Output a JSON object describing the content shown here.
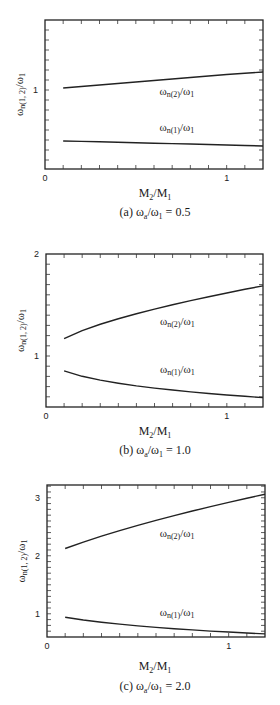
{
  "chart_data": [
    {
      "type": "line",
      "panel_id": "a",
      "caption": "(a) ωa/ω1 = 0.5",
      "caption_parts": {
        "prefix": "(a) ω",
        "sub1": "a",
        "mid": "/ω",
        "sub2": "1",
        "suffix": " = 0.5"
      },
      "xlabel": "M2/M1",
      "ylabel": "ωn(1, 2)/ω1",
      "xlim": [
        0,
        1.2
      ],
      "ylim": [
        0.21,
        1.7
      ],
      "x_ticks_labeled": [
        0,
        1
      ],
      "y_ticks_labeled": [
        1
      ],
      "x_minor_step": 0.1,
      "y_minor_step": 0.1,
      "grid": false,
      "x": [
        0.1,
        0.2,
        0.3,
        0.4,
        0.5,
        0.6,
        0.7,
        0.8,
        0.9,
        1.0,
        1.1,
        1.2
      ],
      "series": [
        {
          "name": "ωn(2)/ω1",
          "label_main": "ω",
          "label_sub": "n(2)",
          "label_rest": "/ω",
          "label_sub2": "1",
          "values": [
            1.02,
            1.035,
            1.05,
            1.065,
            1.08,
            1.095,
            1.11,
            1.125,
            1.14,
            1.155,
            1.168,
            1.18
          ],
          "label_pos": [
            0.63,
            0.95
          ]
        },
        {
          "name": "ωn(1)/ω1",
          "label_main": "ω",
          "label_sub": "n(1)",
          "label_rest": "/ω",
          "label_sub2": "1",
          "values": [
            0.49,
            0.486,
            0.482,
            0.477,
            0.472,
            0.468,
            0.464,
            0.46,
            0.455,
            0.45,
            0.445,
            0.44
          ],
          "label_pos": [
            0.63,
            0.59
          ]
        }
      ]
    },
    {
      "type": "line",
      "panel_id": "b",
      "caption": "(b) ωa/ω1 = 1.0",
      "caption_parts": {
        "prefix": "(b) ω",
        "sub1": "a",
        "mid": "/ω",
        "sub2": "1",
        "suffix": " = 1.0"
      },
      "xlabel": "M2/M1",
      "ylabel": "ωn(1, 2)/ω1",
      "xlim": [
        0,
        1.2
      ],
      "ylim": [
        0.5,
        2.0
      ],
      "x_ticks_labeled": [
        0,
        1
      ],
      "y_ticks_labeled": [
        1,
        2
      ],
      "x_minor_step": 0.1,
      "y_minor_step": 0.1,
      "grid": false,
      "x": [
        0.1,
        0.2,
        0.3,
        0.4,
        0.5,
        0.6,
        0.7,
        0.8,
        0.9,
        1.0,
        1.1,
        1.2
      ],
      "series": [
        {
          "name": "ωn(2)/ω1",
          "label_main": "ω",
          "label_sub": "n(2)",
          "label_rest": "/ω",
          "label_sub2": "1",
          "values": [
            1.17,
            1.248,
            1.311,
            1.365,
            1.414,
            1.46,
            1.502,
            1.543,
            1.581,
            1.618,
            1.654,
            1.688
          ],
          "label_pos": [
            0.63,
            1.3
          ]
        },
        {
          "name": "ωn(1)/ω1",
          "label_main": "ω",
          "label_sub": "n(1)",
          "label_rest": "/ω",
          "label_sub2": "1",
          "values": [
            0.854,
            0.801,
            0.763,
            0.733,
            0.707,
            0.685,
            0.666,
            0.648,
            0.632,
            0.618,
            0.605,
            0.592
          ],
          "label_pos": [
            0.63,
            0.83
          ]
        }
      ]
    },
    {
      "type": "line",
      "panel_id": "c",
      "caption": "(c) ωa/ω1 = 2.0",
      "caption_parts": {
        "prefix": "(c) ω",
        "sub1": "a",
        "mid": "/ω",
        "sub2": "1",
        "suffix": " = 2.0"
      },
      "xlabel": "M2/M1",
      "ylabel": "ωn(1, 2)/ω1",
      "xlim": [
        0,
        1.2
      ],
      "ylim": [
        0.6,
        3.22
      ],
      "x_ticks_labeled": [
        0,
        1
      ],
      "y_ticks_labeled": [
        1,
        2,
        3
      ],
      "x_minor_step": 0.1,
      "y_minor_step": 0.1,
      "grid": false,
      "x": [
        0.1,
        0.2,
        0.3,
        0.4,
        0.5,
        0.6,
        0.7,
        0.8,
        0.9,
        1.0,
        1.1,
        1.2
      ],
      "series": [
        {
          "name": "ωn(2)/ω1",
          "label_main": "ω",
          "label_sub": "n(2)",
          "label_rest": "/ω",
          "label_sub2": "1",
          "values": [
            2.125,
            2.236,
            2.338,
            2.434,
            2.524,
            2.61,
            2.692,
            2.771,
            2.847,
            2.921,
            2.992,
            3.061
          ],
          "label_pos": [
            0.62,
            2.32
          ]
        },
        {
          "name": "ωn(1)/ω1",
          "label_main": "ω",
          "label_sub": "n(1)",
          "label_rest": "/ω",
          "label_sub2": "1",
          "values": [
            0.941,
            0.894,
            0.855,
            0.822,
            0.792,
            0.766,
            0.743,
            0.722,
            0.702,
            0.685,
            0.668,
            0.653
          ],
          "label_pos": [
            0.62,
            0.97
          ]
        }
      ]
    }
  ],
  "layout": {
    "panels": [
      {
        "frame": {
          "left": 45,
          "right": 263,
          "top": 20,
          "bottom": 169
        },
        "xlabel_top": 186,
        "caption_top": 205
      },
      {
        "frame": {
          "left": 46,
          "right": 263,
          "top": 254,
          "bottom": 407
        },
        "xlabel_top": 424,
        "caption_top": 443
      },
      {
        "frame": {
          "left": 47,
          "right": 265,
          "top": 485,
          "bottom": 637
        },
        "xlabel_top": 659,
        "caption_top": 679
      }
    ]
  }
}
